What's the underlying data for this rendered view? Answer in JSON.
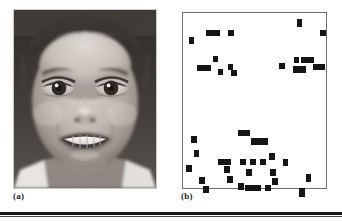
{
  "figure": {
    "panels": [
      {
        "id": "a",
        "caption": "(a)",
        "kind": "photograph",
        "description": "grayscale frontal portrait of a smiling woman"
      },
      {
        "id": "b",
        "caption": "(b)",
        "kind": "block-map",
        "description": "sparse binary map of black rectangular blocks on white background"
      }
    ]
  },
  "chart_data": {
    "type": "scatter",
    "title": "",
    "xlabel": "",
    "ylabel": "",
    "xlim": [
      0,
      145
    ],
    "ylim": [
      0,
      177
    ],
    "grid": false,
    "legend": null,
    "note": "Panel (b): black rectangular blocks marking detected feature locations. Coordinates are top-left x,y in panel pixels with width/height.",
    "blocks": [
      {
        "x": 6,
        "y": 24,
        "w": 5,
        "h": 7
      },
      {
        "x": 23,
        "y": 17,
        "w": 14,
        "h": 6
      },
      {
        "x": 45,
        "y": 17,
        "w": 6,
        "h": 6
      },
      {
        "x": 114,
        "y": 6,
        "w": 5,
        "h": 8
      },
      {
        "x": 137,
        "y": 17,
        "w": 6,
        "h": 6
      },
      {
        "x": 30,
        "y": 43,
        "w": 5,
        "h": 6
      },
      {
        "x": 14,
        "y": 52,
        "w": 14,
        "h": 6
      },
      {
        "x": 35,
        "y": 56,
        "w": 5,
        "h": 6
      },
      {
        "x": 45,
        "y": 51,
        "w": 5,
        "h": 6
      },
      {
        "x": 48,
        "y": 57,
        "w": 6,
        "h": 6
      },
      {
        "x": 96,
        "y": 50,
        "w": 6,
        "h": 6
      },
      {
        "x": 111,
        "y": 44,
        "w": 5,
        "h": 6
      },
      {
        "x": 110,
        "y": 53,
        "w": 13,
        "h": 7
      },
      {
        "x": 118,
        "y": 44,
        "w": 13,
        "h": 6
      },
      {
        "x": 130,
        "y": 51,
        "w": 12,
        "h": 6
      },
      {
        "x": 55,
        "y": 117,
        "w": 12,
        "h": 6
      },
      {
        "x": 68,
        "y": 125,
        "w": 17,
        "h": 7
      },
      {
        "x": 8,
        "y": 123,
        "w": 6,
        "h": 7
      },
      {
        "x": 11,
        "y": 137,
        "w": 5,
        "h": 7
      },
      {
        "x": 35,
        "y": 146,
        "w": 13,
        "h": 6
      },
      {
        "x": 41,
        "y": 153,
        "w": 6,
        "h": 7
      },
      {
        "x": 57,
        "y": 146,
        "w": 6,
        "h": 6
      },
      {
        "x": 67,
        "y": 146,
        "w": 6,
        "h": 6
      },
      {
        "x": 77,
        "y": 146,
        "w": 6,
        "h": 6
      },
      {
        "x": 86,
        "y": 140,
        "w": 6,
        "h": 7
      },
      {
        "x": 100,
        "y": 146,
        "w": 5,
        "h": 7
      },
      {
        "x": 3,
        "y": 152,
        "w": 6,
        "h": 7
      },
      {
        "x": 63,
        "y": 156,
        "w": 6,
        "h": 7
      },
      {
        "x": 87,
        "y": 156,
        "w": 6,
        "h": 7
      },
      {
        "x": 44,
        "y": 163,
        "w": 6,
        "h": 7
      },
      {
        "x": 16,
        "y": 164,
        "w": 6,
        "h": 7
      },
      {
        "x": 89,
        "y": 165,
        "w": 6,
        "h": 7
      },
      {
        "x": 123,
        "y": 161,
        "w": 5,
        "h": 8
      },
      {
        "x": 55,
        "y": 170,
        "w": 6,
        "h": 7
      },
      {
        "x": 62,
        "y": 172,
        "w": 16,
        "h": 6
      },
      {
        "x": 82,
        "y": 172,
        "w": 6,
        "h": 6
      },
      {
        "x": 20,
        "y": 173,
        "w": 6,
        "h": 7
      },
      {
        "x": 116,
        "y": 175,
        "w": 6,
        "h": 9
      }
    ]
  }
}
